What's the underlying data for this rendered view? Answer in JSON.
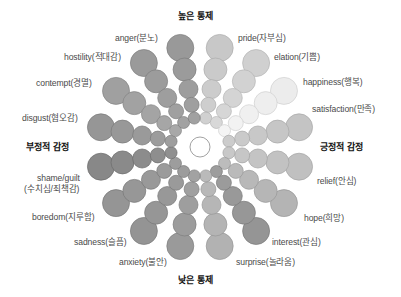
{
  "diagram": {
    "center": {
      "x": 200,
      "y": 147,
      "radius": 10,
      "fill": "#ffffff",
      "stroke": "#8a8a8a"
    },
    "ring_distances": [
      101,
      79,
      59,
      43,
      29.5
    ],
    "ring_radii": [
      13.5,
      11.5,
      9.5,
      7.5,
      6
    ],
    "axes": {
      "top": "높은 통제",
      "bottom": "낮은 통제",
      "left": "부정적 감정",
      "right": "긍정적 감정"
    },
    "emotions": [
      {
        "name": "pride(자부심)",
        "angle": -78.75,
        "fill": "#c8c8c8"
      },
      {
        "name": "elation(기쁨)",
        "angle": -56.25,
        "fill": "#d0d0d0"
      },
      {
        "name": "happiness(행복)",
        "angle": -33.75,
        "fill": "#ececec"
      },
      {
        "name": "satisfaction(만족)",
        "angle": -11.25,
        "fill": "#c4c4c4"
      },
      {
        "name": "relief(안심)",
        "angle": 11.25,
        "fill": "#c0c0c0"
      },
      {
        "name": "hope(희망)",
        "angle": 33.75,
        "fill": "#b4b4b4"
      },
      {
        "name": "interest(관심)",
        "angle": 56.25,
        "fill": "#959595"
      },
      {
        "name": "surprise(놀라움)",
        "angle": 78.75,
        "fill": "#b2b2b2"
      },
      {
        "name": "anxiety(불안)",
        "angle": 101.25,
        "fill": "#9a9a9a"
      },
      {
        "name": "sadness(슬픔)",
        "angle": 123.75,
        "fill": "#949494"
      },
      {
        "name": "boredom(지루함)",
        "angle": 146.25,
        "fill": "#959595"
      },
      {
        "name": "shame/guilt (수치심/죄책감)",
        "angle": 168.75,
        "fill": "#888888"
      },
      {
        "name": "disgust(혐오감)",
        "angle": 191.25,
        "fill": "#969696"
      },
      {
        "name": "contempt(경멸)",
        "angle": 213.75,
        "fill": "#a0a0a0"
      },
      {
        "name": "hostility(적대감)",
        "angle": 236.25,
        "fill": "#9a9a9a"
      },
      {
        "name": "anger(분노)",
        "angle": 258.75,
        "fill": "#999999"
      }
    ]
  },
  "labels": {
    "pride": "pride(자부심)",
    "elation": "elation(기쁨)",
    "happiness": "happiness(행복)",
    "satisfaction": "satisfaction(만족)",
    "relief": "relief(안심)",
    "hope": "hope(희망)",
    "interest": "interest(관심)",
    "surprise": "surprise(놀라움)",
    "anxiety": "anxiety(불안)",
    "sadness": "sadness(슬픔)",
    "boredom": "boredom(지루함)",
    "shame_line1": "shame/guilt",
    "shame_line2": "(수치심/죄책감)",
    "disgust": "disgust(혐오감)",
    "contempt": "contempt(경멸)",
    "hostility": "hostility(적대감)",
    "anger": "anger(분노)"
  }
}
